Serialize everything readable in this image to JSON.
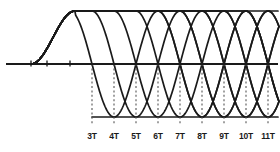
{
  "figure": {
    "title": "",
    "background_color": "#ffffff",
    "curve_color": "#1a1a1a",
    "axis_color": "#1a1a1a",
    "guide_color": "#555555"
  },
  "axis": {
    "baseline_y": 64,
    "origin_x": 31,
    "top_level_y": 11,
    "bottom_level_y": 117,
    "left_ticks_x": [
      31,
      47,
      70
    ],
    "axis_start_x": 6,
    "axis_end_x": 278
  },
  "xaxis": {
    "tick_labels": [
      "3T",
      "4T",
      "5T",
      "6T",
      "7T",
      "8T",
      "9T",
      "10T",
      "11T"
    ],
    "tick_positions_x": [
      92,
      114,
      136,
      158,
      180,
      202,
      224,
      246,
      268
    ],
    "label_y": 132,
    "dashed_top_y": 64,
    "dashed_bottom_y": 124
  },
  "chart_data": {
    "type": "line",
    "title": "",
    "xlabel": "",
    "ylabel": "",
    "grid": false,
    "legend": "none",
    "xlim": [
      0,
      12
    ],
    "ylim": [
      -1,
      1
    ],
    "xtick_labels": [
      "3T",
      "4T",
      "5T",
      "6T",
      "7T",
      "8T",
      "9T",
      "10T",
      "11T"
    ],
    "xtick_values": [
      3,
      4,
      5,
      6,
      7,
      8,
      9,
      10,
      11
    ],
    "transition_instants": [
      3,
      4,
      5,
      6,
      7,
      8,
      9,
      10,
      11
    ],
    "series": [
      {
        "name": "response-3T",
        "turn_at": 3,
        "direction": "down"
      },
      {
        "name": "response-4T",
        "turn_at": 4,
        "direction": "down"
      },
      {
        "name": "response-5T",
        "turn_at": 5,
        "direction": "down"
      },
      {
        "name": "response-6T",
        "turn_at": 6,
        "direction": "down"
      },
      {
        "name": "response-7T",
        "turn_at": 7,
        "direction": "down"
      },
      {
        "name": "response-8T",
        "turn_at": 8,
        "direction": "down"
      },
      {
        "name": "response-9T",
        "turn_at": 9,
        "direction": "down"
      },
      {
        "name": "response-10T",
        "turn_at": 10,
        "direction": "down"
      },
      {
        "name": "response-11T",
        "turn_at": 11,
        "direction": "down"
      }
    ]
  }
}
